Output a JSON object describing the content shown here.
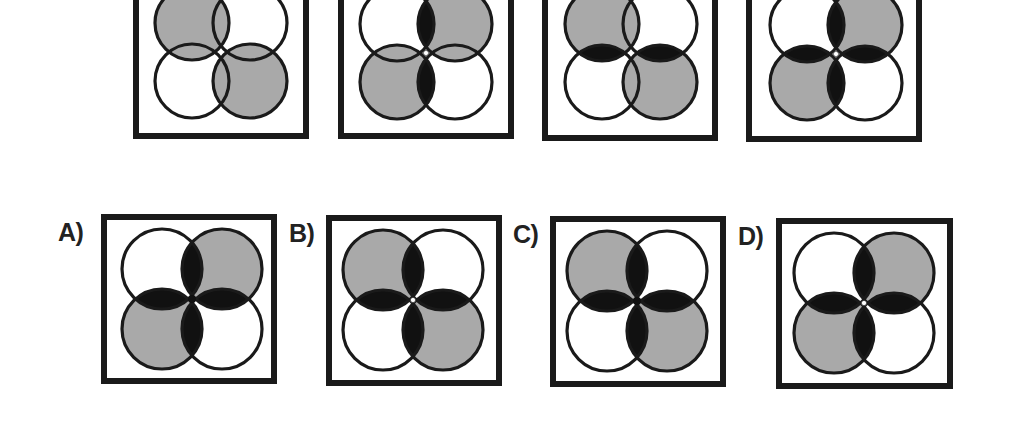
{
  "puzzle": {
    "colors": {
      "grey_fill": "#a9a9a9",
      "lens_fill": "#111111",
      "stroke": "#1a1a1a",
      "background": "#ffffff",
      "center_dot": "#ffffff"
    },
    "sequence": [
      {
        "id": "seq-1",
        "box": {
          "x": 133,
          "y": -32,
          "w": 176,
          "h": 171
        },
        "center": {
          "x": 221,
          "y": 52
        },
        "r": 37,
        "o": 29,
        "grey": [
          "tl",
          "br"
        ],
        "lenses": [],
        "center_dot": false
      },
      {
        "id": "seq-2",
        "box": {
          "x": 338,
          "y": -32,
          "w": 176,
          "h": 171
        },
        "center": {
          "x": 426,
          "y": 53
        },
        "r": 37,
        "o": 29,
        "grey": [
          "tr",
          "bl"
        ],
        "lenses": [
          "top",
          "bottom"
        ],
        "center_dot": true
      },
      {
        "id": "seq-3",
        "box": {
          "x": 542,
          "y": -31,
          "w": 176,
          "h": 172
        },
        "center": {
          "x": 631,
          "y": 53
        },
        "r": 37,
        "o": 29,
        "grey": [
          "tl",
          "br"
        ],
        "lenses": [
          "left",
          "right"
        ],
        "center_dot": false
      },
      {
        "id": "seq-4",
        "box": {
          "x": 746,
          "y": -30,
          "w": 176,
          "h": 172
        },
        "center": {
          "x": 836,
          "y": 54
        },
        "r": 37,
        "o": 29,
        "grey": [
          "tr",
          "bl"
        ],
        "lenses": [
          "top",
          "bottom",
          "left",
          "right"
        ],
        "center_dot": true
      }
    ],
    "options": [
      {
        "letter": "A)",
        "label_pos": {
          "x": 58,
          "y": 220
        },
        "box": {
          "x": 101,
          "y": 214,
          "w": 176,
          "h": 170
        },
        "center": {
          "x": 192,
          "y": 299
        },
        "r": 40,
        "o": 30,
        "grey": [
          "tr",
          "bl"
        ],
        "lenses": [
          "top",
          "bottom",
          "left",
          "right"
        ],
        "center_dot": false
      },
      {
        "letter": "B)",
        "label_pos": {
          "x": 289,
          "y": 221
        },
        "box": {
          "x": 326,
          "y": 215,
          "w": 176,
          "h": 171
        },
        "center": {
          "x": 413,
          "y": 300
        },
        "r": 40,
        "o": 30,
        "grey": [
          "tl",
          "br"
        ],
        "lenses": [
          "top",
          "bottom",
          "left",
          "right"
        ],
        "center_dot": true
      },
      {
        "letter": "C)",
        "label_pos": {
          "x": 513,
          "y": 222
        },
        "box": {
          "x": 550,
          "y": 216,
          "w": 176,
          "h": 171
        },
        "center": {
          "x": 637,
          "y": 301
        },
        "r": 40,
        "o": 30,
        "grey": [
          "tl",
          "br"
        ],
        "lenses": [
          "top",
          "bottom",
          "left",
          "right"
        ],
        "center_dot": false
      },
      {
        "letter": "D)",
        "label_pos": {
          "x": 738,
          "y": 224
        },
        "box": {
          "x": 776,
          "y": 218,
          "w": 177,
          "h": 171
        },
        "center": {
          "x": 864,
          "y": 303
        },
        "r": 40,
        "o": 30,
        "grey": [
          "tr",
          "bl"
        ],
        "lenses": [
          "top",
          "bottom",
          "left",
          "right"
        ],
        "center_dot": true
      }
    ]
  }
}
